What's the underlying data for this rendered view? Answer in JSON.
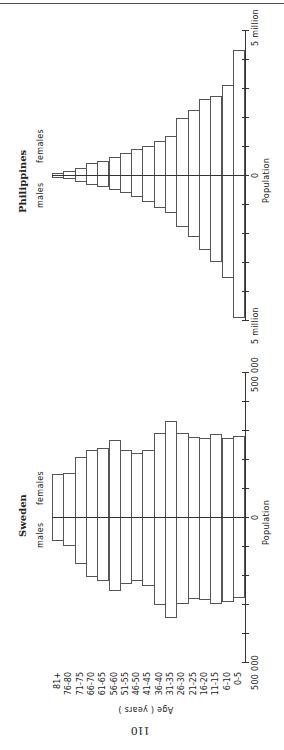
{
  "page": {
    "page_number": "110",
    "age_axis_label": "Age ( years )"
  },
  "chart_data": [
    {
      "type": "bar",
      "subtype": "population_pyramid",
      "title": "Philippines",
      "xlabel": "Population",
      "ylabel": "Age ( years )",
      "unit": "million",
      "axis_labels": {
        "zero": "0",
        "max_left": "5 million",
        "max_right": "5 million",
        "population": "Population"
      },
      "legend": {
        "left": "males",
        "right": "females"
      },
      "tick_step": 1,
      "xlim": [
        -5,
        5
      ],
      "categories": [
        "81+",
        "76-80",
        "71-75",
        "66-70",
        "61-65",
        "56-60",
        "51-55",
        "46-50",
        "41-45",
        "36-40",
        "31-35",
        "26-30",
        "21-25",
        "16-20",
        "11-15",
        "6-10",
        "0-5"
      ],
      "series": [
        {
          "name": "males",
          "values": [
            0.07,
            0.1,
            0.21,
            0.31,
            0.38,
            0.48,
            0.59,
            0.72,
            0.9,
            1.1,
            1.28,
            1.76,
            2.1,
            2.55,
            2.97,
            3.52,
            4.9
          ]
        },
        {
          "name": "females",
          "values": [
            0.07,
            0.14,
            0.24,
            0.41,
            0.48,
            0.62,
            0.76,
            0.9,
            1.0,
            1.17,
            1.34,
            1.97,
            2.24,
            2.62,
            2.72,
            3.1,
            4.31
          ]
        }
      ]
    },
    {
      "type": "bar",
      "subtype": "population_pyramid",
      "title": "Sweden",
      "xlabel": "Population",
      "ylabel": "Age ( years )",
      "unit": "thousand",
      "axis_labels": {
        "zero": "0",
        "max_left": "500 000",
        "max_right": "500 000",
        "population": "Population"
      },
      "legend": {
        "left": "males",
        "right": "females"
      },
      "tick_step": 100,
      "xlim": [
        -500,
        500
      ],
      "categories": [
        "81+",
        "76-80",
        "71-75",
        "66-70",
        "61-65",
        "56-60",
        "51-55",
        "46-50",
        "41-45",
        "36-40",
        "31-35",
        "26-30",
        "21-25",
        "16-20",
        "11-15",
        "6-10",
        "0-5"
      ],
      "series": [
        {
          "name": "males",
          "values": [
            79,
            97,
            159,
            203,
            217,
            252,
            228,
            217,
            234,
            300,
            345,
            297,
            279,
            283,
            297,
            290,
            276
          ]
        },
        {
          "name": "females",
          "values": [
            148,
            152,
            207,
            231,
            238,
            266,
            231,
            221,
            231,
            290,
            331,
            290,
            276,
            272,
            286,
            272,
            279
          ]
        }
      ]
    }
  ]
}
